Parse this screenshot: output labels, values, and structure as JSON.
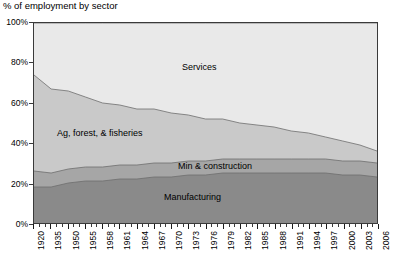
{
  "chart_data": {
    "type": "area",
    "stacked": true,
    "title": "% of employment by sector",
    "xlabel": "",
    "ylabel": "",
    "ylim": [
      0,
      100
    ],
    "ytick_labels": [
      "0%",
      "20%",
      "40%",
      "60%",
      "80%",
      "100%"
    ],
    "ytick_values": [
      0,
      20,
      40,
      60,
      80,
      100
    ],
    "grid": false,
    "legend_position": "inline-labels",
    "x": [
      1920,
      1935,
      1950,
      1955,
      1958,
      1961,
      1964,
      1967,
      1970,
      1973,
      1976,
      1979,
      1982,
      1985,
      1988,
      1991,
      1994,
      1997,
      2000,
      2003,
      2006
    ],
    "xtick_labels": [
      "1920",
      "1935",
      "1950",
      "1955",
      "1958",
      "1961",
      "1964",
      "1967",
      "1970",
      "1973",
      "1976",
      "1979",
      "1982",
      "1985",
      "1988",
      "1991",
      "1994",
      "1997",
      "2000",
      "2003",
      "2006"
    ],
    "series": [
      {
        "name": "Manufacturing",
        "color": "#8a8a8a",
        "label_text": "Manufacturing",
        "values": [
          18,
          18,
          20,
          21,
          21,
          22,
          22,
          23,
          23,
          24,
          24,
          25,
          25,
          25,
          25,
          25,
          25,
          25,
          24,
          24,
          23
        ]
      },
      {
        "name": "Min & construction",
        "color": "#a6a6a6",
        "label_text": "Min & construction",
        "values": [
          8,
          7,
          7,
          7,
          7,
          7,
          7,
          7,
          7,
          7,
          7,
          7,
          7,
          7,
          7,
          7,
          7,
          7,
          7,
          7,
          7
        ]
      },
      {
        "name": "Ag, forest, & fisheries",
        "color": "#c9c9c9",
        "label_text": "Ag, forest, & fisheries",
        "values": [
          48,
          42,
          39,
          35,
          32,
          30,
          28,
          27,
          25,
          23,
          21,
          20,
          18,
          17,
          16,
          14,
          13,
          11,
          10,
          8,
          6
        ]
      },
      {
        "name": "Services",
        "color": "#e9e9e9",
        "label_text": "Services",
        "values": [
          26,
          33,
          34,
          37,
          40,
          41,
          43,
          43,
          45,
          46,
          48,
          48,
          50,
          51,
          52,
          54,
          55,
          57,
          59,
          61,
          64
        ]
      }
    ],
    "cumulative_tops": {
      "manufacturing": [
        18,
        18,
        20,
        21,
        21,
        22,
        22,
        23,
        23,
        24,
        24,
        25,
        25,
        25,
        25,
        25,
        25,
        25,
        24,
        24,
        23
      ],
      "min_construction": [
        26,
        25,
        27,
        28,
        28,
        29,
        29,
        30,
        30,
        31,
        31,
        32,
        32,
        32,
        32,
        32,
        32,
        32,
        31,
        31,
        30
      ],
      "agriculture": [
        74,
        67,
        66,
        63,
        60,
        59,
        57,
        57,
        55,
        54,
        52,
        52,
        50,
        49,
        48,
        46,
        45,
        43,
        41,
        39,
        36
      ],
      "services": [
        100,
        100,
        100,
        100,
        100,
        100,
        100,
        100,
        100,
        100,
        100,
        100,
        100,
        100,
        100,
        100,
        100,
        100,
        100,
        100,
        100
      ]
    }
  },
  "colors": {
    "services": "#e9e9e9",
    "agriculture": "#c9c9c9",
    "min_construction": "#a6a6a6",
    "manufacturing": "#8a8a8a",
    "axis": "#3a3a3a",
    "text": "#000000",
    "background": "#ffffff"
  },
  "title": "% of employment by sector",
  "labels": {
    "services": "Services",
    "agriculture": "Ag, forest, & fisheries",
    "min_construction": "Min & construction",
    "manufacturing": "Manufacturing"
  }
}
